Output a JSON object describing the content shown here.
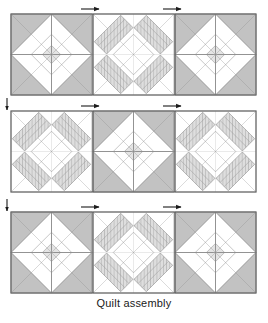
{
  "figure": {
    "caption": "Quilt assembly",
    "type": "quilt-assembly-diagram"
  },
  "colors": {
    "background": "#ffffff",
    "outline": "#6e6e6e",
    "seam_line": "#5a5a5a",
    "thin_line": "#8c8c8c",
    "shade_medium": "#c2c2c2",
    "shade_light": "#e4e4e4",
    "shade_pale": "#efefef",
    "stripe_line": "#9a9a9a",
    "arrow": "#1a1a1a",
    "text": "#1a1a1a"
  },
  "layout": {
    "grid_left": 11,
    "grid_right": 256,
    "block_size": 81,
    "rows": [
      {
        "name": "row-1",
        "top": 14
      },
      {
        "name": "row-2",
        "top": 111
      },
      {
        "name": "row-3",
        "top": 212
      }
    ],
    "columns": [
      {
        "name": "col-1",
        "left": 11
      },
      {
        "name": "col-2",
        "left": 93
      },
      {
        "name": "col-3",
        "left": 175
      }
    ]
  },
  "blocks": [
    {
      "row": 0,
      "col": 0,
      "pattern": "star"
    },
    {
      "row": 0,
      "col": 1,
      "pattern": "striped"
    },
    {
      "row": 0,
      "col": 2,
      "pattern": "star"
    },
    {
      "row": 1,
      "col": 0,
      "pattern": "striped"
    },
    {
      "row": 1,
      "col": 1,
      "pattern": "star"
    },
    {
      "row": 1,
      "col": 2,
      "pattern": "striped"
    },
    {
      "row": 2,
      "col": 0,
      "pattern": "star"
    },
    {
      "row": 2,
      "col": 1,
      "pattern": "striped"
    },
    {
      "row": 2,
      "col": 2,
      "pattern": "star"
    }
  ],
  "pressing_arrows": {
    "horizontal": [
      {
        "name": "seam-arrow-row1-a",
        "x": 94,
        "y": 9,
        "direction": "right"
      },
      {
        "name": "seam-arrow-row1-b",
        "x": 176,
        "y": 9,
        "direction": "right"
      },
      {
        "name": "seam-arrow-row2-a",
        "x": 94,
        "y": 106,
        "direction": "right"
      },
      {
        "name": "seam-arrow-row2-b",
        "x": 176,
        "y": 106,
        "direction": "right"
      },
      {
        "name": "seam-arrow-row3-a",
        "x": 94,
        "y": 207,
        "direction": "right"
      },
      {
        "name": "seam-arrow-row3-b",
        "x": 176,
        "y": 207,
        "direction": "right"
      }
    ],
    "vertical": [
      {
        "name": "seam-arrow-left-1",
        "x": 7,
        "y": 104,
        "direction": "down"
      },
      {
        "name": "seam-arrow-left-2",
        "x": 7,
        "y": 205,
        "direction": "down"
      }
    ]
  }
}
